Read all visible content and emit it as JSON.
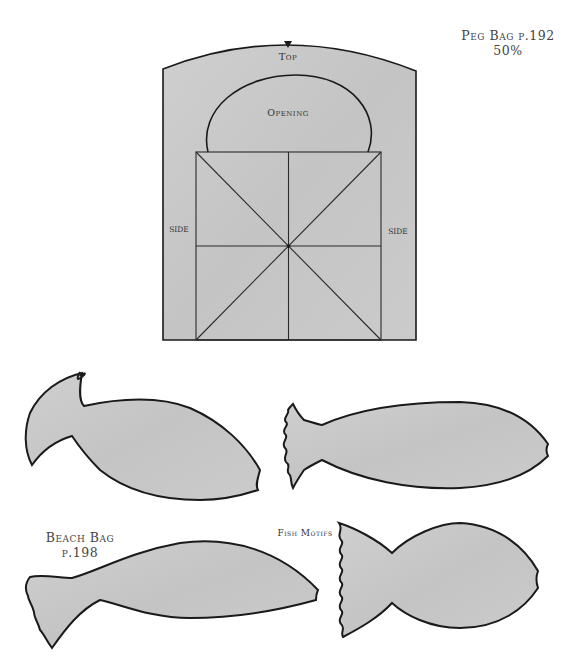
{
  "peg_bag": {
    "title_line1": "Peg Bag p.192",
    "title_line2": "50%",
    "labels": {
      "top": "Top",
      "opening": "Opening",
      "side_left": "SIDE",
      "side_right": "SIDE"
    }
  },
  "beach_bag": {
    "title_line1": "Beach Bag",
    "title_line2": "p.198"
  },
  "fish_motifs_label": "Fish Motifs",
  "colors": {
    "template_fill": "#c8c8c8",
    "outline": "#1a1a1a",
    "background": "#ffffff",
    "text": "#444444"
  }
}
